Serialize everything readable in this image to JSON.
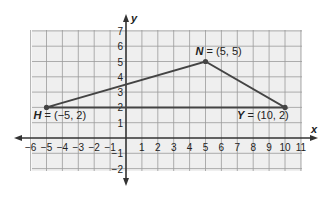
{
  "diagram": {
    "type": "coordinate-plane-triangle",
    "axes": {
      "x_label": "x",
      "y_label": "y",
      "x_ticks": [
        "-6",
        "-5",
        "-4",
        "-3",
        "-2",
        "-1",
        "1",
        "2",
        "3",
        "4",
        "5",
        "6",
        "7",
        "8",
        "9",
        "10",
        "11"
      ],
      "y_ticks": [
        "7",
        "6",
        "5",
        "4",
        "3",
        "2",
        "1",
        "-1",
        "-2"
      ],
      "x_range": [
        -6,
        11
      ],
      "y_range": [
        -2,
        7
      ]
    },
    "points": [
      {
        "name": "H",
        "x": -5,
        "y": 2,
        "label_rest": " = (−5, 2)"
      },
      {
        "name": "N",
        "x": 5,
        "y": 5,
        "label_rest": " = (5, 5)"
      },
      {
        "name": "Y",
        "x": 10,
        "y": 2,
        "label_rest": " = (10, 2)"
      }
    ],
    "colors": {
      "grid_bg": "#efefef",
      "grid_line": "#9a9a9a",
      "axis": "#333333",
      "triangle": "#444444"
    }
  }
}
